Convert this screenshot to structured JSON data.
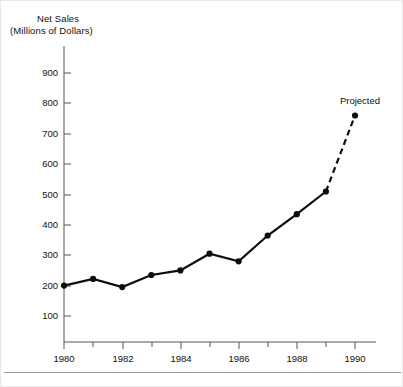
{
  "chart_data": {
    "type": "line",
    "title": "Net Sales",
    "subtitle": "(Millions of Dollars)",
    "xlabel": "",
    "ylabel": "Net Sales (Millions of Dollars)",
    "x": [
      1980,
      1981,
      1982,
      1983,
      1984,
      1985,
      1986,
      1987,
      1988,
      1989,
      1990
    ],
    "values": [
      200,
      222,
      195,
      235,
      250,
      305,
      280,
      365,
      435,
      510,
      760
    ],
    "series": [
      {
        "name": "Net Sales",
        "style": "solid",
        "x": [
          1980,
          1981,
          1982,
          1983,
          1984,
          1985,
          1986,
          1987,
          1988,
          1989
        ],
        "values": [
          200,
          222,
          195,
          235,
          250,
          305,
          280,
          365,
          435,
          510
        ]
      },
      {
        "name": "Projected",
        "style": "dashed",
        "x": [
          1989,
          1990
        ],
        "values": [
          510,
          760
        ]
      }
    ],
    "annotations": [
      {
        "text": "Projected",
        "x": 1990,
        "y": 800
      }
    ],
    "xlim": [
      1980,
      1990
    ],
    "ylim": [
      0,
      950
    ],
    "ytick_labels": [
      "900",
      "800",
      "700",
      "600",
      "500",
      "400",
      "300",
      "200",
      "100"
    ],
    "ytick_values": [
      900,
      800,
      700,
      600,
      500,
      400,
      300,
      200,
      100
    ],
    "xtick_labels": [
      "1980",
      "1982",
      "1984",
      "1986",
      "1988",
      "1990"
    ],
    "xtick_values": [
      1980,
      1982,
      1984,
      1986,
      1988,
      1990
    ],
    "xtick_minor_values": [
      1981,
      1983,
      1985,
      1987,
      1989
    ],
    "grid": false,
    "legend": "none",
    "marker": "filled-circle",
    "line_color": "#0d0d0d",
    "axis_color": "#555555",
    "background_color": "#ffffff"
  },
  "labels": {
    "title_line_1": "Net Sales",
    "title_line_2": "(Millions of Dollars)",
    "projected": "Projected",
    "y_900": "900",
    "y_800": "800",
    "y_700": "700",
    "y_600": "600",
    "y_500": "500",
    "y_400": "400",
    "y_300": "300",
    "y_200": "200",
    "y_100": "100",
    "x_1980": "1980",
    "x_1982": "1982",
    "x_1984": "1984",
    "x_1986": "1986",
    "x_1988": "1988",
    "x_1990": "1990"
  }
}
